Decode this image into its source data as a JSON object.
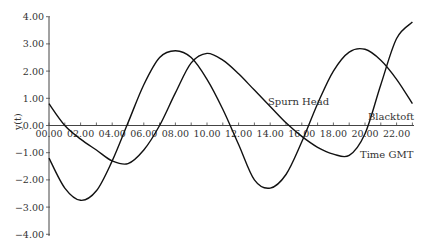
{
  "chart_data": {
    "type": "line",
    "title": "",
    "xlabel": "Time GMT",
    "ylabel": "y(t)",
    "xlim": [
      0,
      23
    ],
    "ylim": [
      -4,
      4
    ],
    "grid": false,
    "legend_position": "inline labels",
    "x_ticks": [
      "00.00",
      "02.00",
      "04.00",
      "06.00",
      "08.00",
      "10.00",
      "12.00",
      "14.00",
      "16.00",
      "18.00",
      "20.00",
      "22.00"
    ],
    "y_ticks": [
      "4.00",
      "3.00",
      "2.00",
      "1.00",
      "0.00",
      "-1.00",
      "-2.00",
      "-3.00",
      "-4.00"
    ],
    "x": [
      0,
      1,
      2,
      3,
      4,
      5,
      6,
      7,
      8,
      9,
      10,
      11,
      12,
      13,
      14,
      15,
      16,
      17,
      18,
      19,
      20,
      21,
      22,
      23
    ],
    "series": [
      {
        "name": "Spurn Head",
        "values": [
          -1.2,
          -2.3,
          -2.75,
          -2.4,
          -1.3,
          0.1,
          1.5,
          2.5,
          2.75,
          2.5,
          1.7,
          0.6,
          -0.7,
          -2.0,
          -2.3,
          -1.8,
          -0.6,
          0.8,
          2.0,
          2.7,
          2.8,
          2.4,
          1.7,
          0.8
        ]
      },
      {
        "name": "Blacktoft",
        "values": [
          0.8,
          0.0,
          -0.5,
          -0.9,
          -1.3,
          -1.4,
          -0.9,
          0.0,
          1.2,
          2.3,
          2.65,
          2.4,
          1.9,
          1.3,
          0.7,
          0.1,
          -0.4,
          -0.8,
          -1.05,
          -1.1,
          -0.3,
          1.5,
          3.2,
          3.8
        ]
      }
    ],
    "annotations": [
      {
        "text": "Spurn Head",
        "near_x": 14.5,
        "near_y": 0.9
      },
      {
        "text": "Blacktoft",
        "near_x": 21.5,
        "near_y": 0.3
      }
    ]
  },
  "labels": {
    "y_axis": "y(t)",
    "x_axis": "Time GMT",
    "spurn_head": "Spurn Head",
    "blacktoft": "Blacktoft"
  }
}
